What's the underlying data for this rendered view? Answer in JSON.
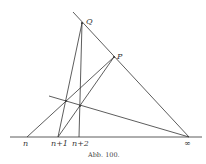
{
  "figure": {
    "caption": "Abb. 100.",
    "labels": {
      "n": "n",
      "n1": "n+1",
      "n2": "n+2",
      "inf": "∞",
      "P": "P",
      "Q": "Q"
    },
    "points": {
      "n": [
        27,
        137
      ],
      "n1": [
        58,
        137
      ],
      "n2": [
        79,
        137
      ],
      "inf": [
        189,
        137
      ],
      "P": [
        114,
        57
      ],
      "Q": [
        82,
        23
      ]
    },
    "stroke_color": "#333333"
  }
}
